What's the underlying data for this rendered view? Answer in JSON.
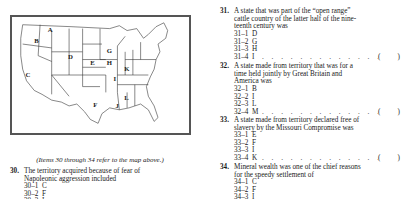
{
  "map": {
    "labels": [
      {
        "letter": "A",
        "x": 36,
        "y": 15
      },
      {
        "letter": "B",
        "x": 22,
        "y": 27
      },
      {
        "letter": "C",
        "x": 13,
        "y": 62
      },
      {
        "letter": "D",
        "x": 57,
        "y": 43
      },
      {
        "letter": "E",
        "x": 80,
        "y": 50
      },
      {
        "letter": "F",
        "x": 83,
        "y": 93
      },
      {
        "letter": "G",
        "x": 97,
        "y": 37
      },
      {
        "letter": "H",
        "x": 97,
        "y": 50
      },
      {
        "letter": "I",
        "x": 104,
        "y": 66
      },
      {
        "letter": "J",
        "x": 106,
        "y": 94
      },
      {
        "letter": "K",
        "x": 115,
        "y": 56
      },
      {
        "letter": "L",
        "x": 115,
        "y": 86
      }
    ]
  },
  "caption": "(Items 30 through 34 refer to the map above.)",
  "questions": [
    {
      "number": "30.",
      "stem_lines": [
        "The territory acquired because of fear of",
        "Napoleonic aggression included"
      ],
      "options": [
        {
          "code": "30–1",
          "letter": "C"
        },
        {
          "code": "30–2",
          "letter": "F"
        },
        {
          "code": "30–3",
          "letter": "I"
        }
      ]
    },
    {
      "number": "31.",
      "stem_lines": [
        "A state that was part of the “open range”",
        "cattle country of the latter half of the nine-",
        "teenth century was"
      ],
      "options": [
        {
          "code": "31–1",
          "letter": "D"
        },
        {
          "code": "31–2",
          "letter": "G"
        },
        {
          "code": "31–3",
          "letter": "H"
        },
        {
          "code": "31–4",
          "letter": "I"
        }
      ],
      "answer_blank": "(      )"
    },
    {
      "number": "32.",
      "stem_lines": [
        "A state made from territory that was for a",
        "time held jointly by Great Britain and",
        "America was"
      ],
      "options": [
        {
          "code": "32–1",
          "letter": "B"
        },
        {
          "code": "32–2",
          "letter": "I"
        },
        {
          "code": "32–3",
          "letter": "L"
        },
        {
          "code": "32–4",
          "letter": "M"
        }
      ],
      "answer_blank": "(      )"
    },
    {
      "number": "33.",
      "stem_lines": [
        "A state made from territory declared free of",
        "slavery by the Missouri Compromise was"
      ],
      "options": [
        {
          "code": "33–1",
          "letter": "E"
        },
        {
          "code": "33–2",
          "letter": "F"
        },
        {
          "code": "33–3",
          "letter": "I"
        },
        {
          "code": "33–4",
          "letter": "K"
        }
      ],
      "answer_blank": "(      )"
    },
    {
      "number": "34.",
      "stem_lines": [
        "Mineral wealth was one of the chief reasons",
        "for the speedy settlement of"
      ],
      "options": [
        {
          "code": "34–1",
          "letter": "C"
        },
        {
          "code": "34–2",
          "letter": "F"
        },
        {
          "code": "34–3",
          "letter": "I"
        }
      ]
    }
  ],
  "leader_dots": ". . . . . . . . . . . . . . . . . .",
  "paren_open": "(",
  "paren_close": ")"
}
